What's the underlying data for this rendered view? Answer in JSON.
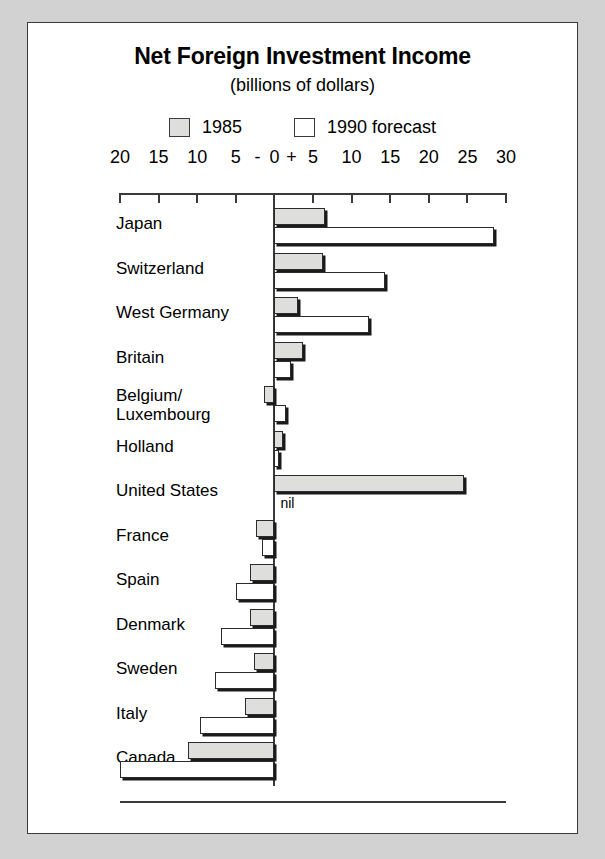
{
  "figure": {
    "title": "Net Foreign Investment Income",
    "subtitle": "(billions of dollars)"
  },
  "legend": {
    "items": [
      {
        "key": "1985",
        "label": "1985",
        "swatch": "grey-filled-square",
        "color": "#dededc"
      },
      {
        "key": "1990",
        "label": "1990 forecast",
        "swatch": "white-square",
        "color": "#ffffff"
      }
    ]
  },
  "axis": {
    "tick_labels": [
      "20",
      "15",
      "10",
      "5",
      "0",
      "5",
      "10",
      "15",
      "20",
      "25",
      "30"
    ],
    "tick_values": [
      -20,
      -15,
      -10,
      -5,
      0,
      5,
      10,
      15,
      20,
      25,
      30
    ],
    "negative_sign": "-",
    "positive_sign": "+",
    "min": -20,
    "max": 30
  },
  "annotations": {
    "nil": "nil"
  },
  "chart_data": {
    "type": "bar",
    "orientation": "horizontal",
    "title": "Net Foreign Investment Income",
    "subtitle": "(billions of dollars)",
    "xlabel": "billions of dollars",
    "ylabel": "",
    "xlim": [
      -20,
      30
    ],
    "grid": false,
    "legend_position": "top-center",
    "categories": [
      "Japan",
      "Switzerland",
      "West Germany",
      "Britain",
      "Belgium/\nLuxembourg",
      "Holland",
      "United States",
      "France",
      "Spain",
      "Denmark",
      "Sweden",
      "Italy",
      "Canada"
    ],
    "series": [
      {
        "name": "1985",
        "color": "#dededc",
        "values": [
          6.5,
          6.3,
          3.0,
          3.7,
          -1.3,
          1.1,
          24.6,
          -2.4,
          -3.1,
          -3.2,
          -2.6,
          -3.8,
          -11.2
        ]
      },
      {
        "name": "1990 forecast",
        "color": "#ffffff",
        "values": [
          28.5,
          14.3,
          12.2,
          2.1,
          1.5,
          0.6,
          0.0,
          -1.6,
          -5.0,
          -6.9,
          -7.7,
          -9.6,
          -20.0
        ]
      }
    ]
  }
}
